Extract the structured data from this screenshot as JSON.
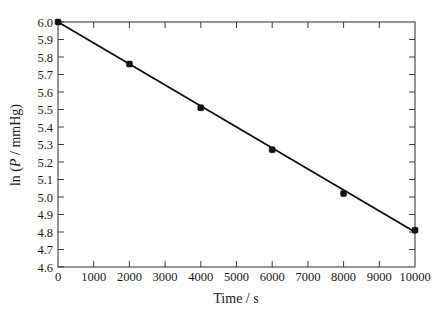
{
  "chart_data": {
    "type": "line",
    "title": "",
    "subtitle": "",
    "xlabel": "Time / s",
    "ylabel": "ln (P / mmHg)",
    "ylabel_parts": {
      "prefix": "ln (",
      "italic": "P",
      "suffix": " / mmHg)"
    },
    "xlim": [
      0,
      10000
    ],
    "ylim": [
      4.6,
      6.0
    ],
    "grid": false,
    "legend": null,
    "x_ticks": [
      0,
      1000,
      2000,
      3000,
      4000,
      5000,
      6000,
      7000,
      8000,
      9000,
      10000
    ],
    "x_tick_labels": [
      "0",
      "1000",
      "2000",
      "3000",
      "4000",
      "5000",
      "6000",
      "7000",
      "8000",
      "9000",
      "10000"
    ],
    "y_ticks": [
      4.6,
      4.7,
      4.8,
      4.9,
      5.0,
      5.1,
      5.2,
      5.3,
      5.4,
      5.5,
      5.6,
      5.7,
      5.8,
      5.9,
      6.0
    ],
    "y_tick_labels": [
      "4.6",
      "4.7",
      "4.8",
      "4.9",
      "5.0",
      "5.1",
      "5.2",
      "5.3",
      "5.4",
      "5.5",
      "5.6",
      "5.7",
      "5.8",
      "5.9",
      "6.0"
    ],
    "series": [
      {
        "name": "ln P vs time",
        "marker": "filled-square",
        "color": "#111111",
        "x": [
          0,
          2000,
          4000,
          6000,
          8000,
          10000
        ],
        "values": [
          6.0,
          5.76,
          5.51,
          5.27,
          5.02,
          4.81
        ]
      }
    ],
    "fit_line": {
      "x": [
        0,
        10000
      ],
      "y": [
        6.0,
        4.8
      ]
    }
  }
}
